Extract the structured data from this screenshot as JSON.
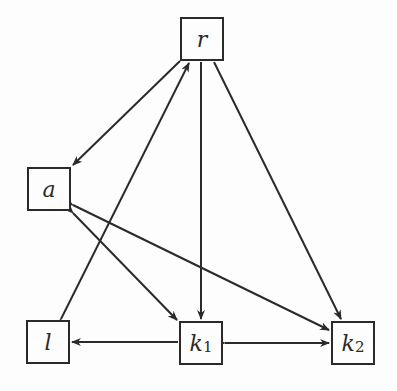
{
  "diagram": {
    "type": "directed-graph",
    "nodes": [
      {
        "id": "r",
        "label": "r",
        "sub": "",
        "x": 180,
        "y": 17,
        "w": 44,
        "h": 44
      },
      {
        "id": "a",
        "label": "a",
        "sub": "",
        "x": 27,
        "y": 167,
        "w": 44,
        "h": 44
      },
      {
        "id": "l",
        "label": "l",
        "sub": "",
        "x": 26,
        "y": 320,
        "w": 44,
        "h": 44
      },
      {
        "id": "k1",
        "label": "k",
        "sub": "1",
        "x": 179,
        "y": 321,
        "w": 44,
        "h": 44
      },
      {
        "id": "k2",
        "label": "k",
        "sub": "2",
        "x": 331,
        "y": 321,
        "w": 44,
        "h": 44
      }
    ],
    "edges": [
      {
        "from": "r",
        "to": "a",
        "bidirectional": false
      },
      {
        "from": "r",
        "to": "l",
        "bidirectional": true
      },
      {
        "from": "r",
        "to": "k1",
        "bidirectional": false
      },
      {
        "from": "r",
        "to": "k2",
        "bidirectional": false
      },
      {
        "from": "a",
        "to": "k1",
        "bidirectional": true
      },
      {
        "from": "a",
        "to": "k2",
        "bidirectional": true
      },
      {
        "from": "k1",
        "to": "l",
        "bidirectional": false
      },
      {
        "from": "k1",
        "to": "k2",
        "bidirectional": true
      }
    ],
    "colors": {
      "stroke": "#2a2a2a",
      "background": "#fdfdfd"
    }
  }
}
